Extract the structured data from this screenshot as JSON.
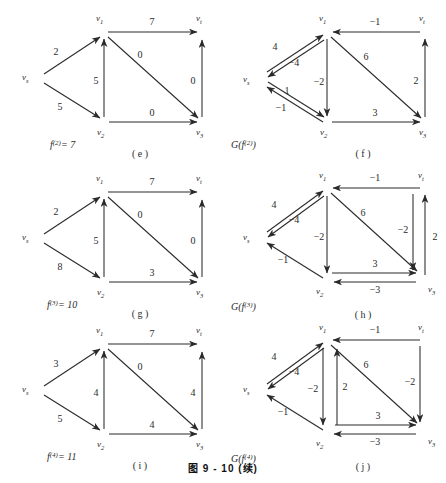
{
  "figure": {
    "caption": "图 9 - 10 (续)",
    "nodes": {
      "s": "v",
      "s_sub": "s",
      "one": "v",
      "one_sub": "1",
      "two": "v",
      "two_sub": "2",
      "three": "v",
      "three_sub": "3",
      "t": "v",
      "t_sub": "t"
    },
    "ink": "#2a2a2a"
  },
  "panels": [
    {
      "id": "e",
      "letter": "( e )",
      "title": "f",
      "title_sup": "(2)",
      "title_eq": "= 7",
      "kind": "flow",
      "edges": [
        {
          "name": "vs-v1",
          "label": "2"
        },
        {
          "name": "vs-v2",
          "label": "5"
        },
        {
          "name": "v2-v1",
          "label": "5"
        },
        {
          "name": "v1-vt",
          "label": "7"
        },
        {
          "name": "v1-v3",
          "label": "0"
        },
        {
          "name": "v2-v3",
          "label": "0"
        },
        {
          "name": "v3-vt",
          "label": "0"
        }
      ]
    },
    {
      "id": "f",
      "letter": "( f )",
      "title": "G(f",
      "title_sup": "(2)",
      "title_eq": ")",
      "kind": "residual",
      "edges": [
        {
          "name": "vs-v1",
          "label": "4"
        },
        {
          "name": "v1-vs",
          "label": "−4"
        },
        {
          "name": "vs-v2",
          "label": "1"
        },
        {
          "name": "v2-vs",
          "label": "−1"
        },
        {
          "name": "v1-v2",
          "label": "−2"
        },
        {
          "name": "vt-v1",
          "label": "−1"
        },
        {
          "name": "v1-v3",
          "label": "6"
        },
        {
          "name": "v2-v3",
          "label": "3"
        },
        {
          "name": "v3-vt",
          "label": "2"
        }
      ]
    },
    {
      "id": "g",
      "letter": "( g )",
      "title": "f",
      "title_sup": "(3)",
      "title_eq": "= 10",
      "kind": "flow",
      "edges": [
        {
          "name": "vs-v1",
          "label": "2"
        },
        {
          "name": "vs-v2",
          "label": "8"
        },
        {
          "name": "v2-v1",
          "label": "5"
        },
        {
          "name": "v1-vt",
          "label": "7"
        },
        {
          "name": "v1-v3",
          "label": "0"
        },
        {
          "name": "v2-v3",
          "label": "3"
        },
        {
          "name": "v3-vt",
          "label": "0"
        }
      ]
    },
    {
      "id": "h",
      "letter": "( h )",
      "title": "G(f",
      "title_sup": "(3)",
      "title_eq": ")",
      "kind": "residual",
      "edges": [
        {
          "name": "vs-v1",
          "label": "4"
        },
        {
          "name": "v1-vs",
          "label": "−4"
        },
        {
          "name": "v2-vs",
          "label": "−1"
        },
        {
          "name": "v1-v2",
          "label": "−2"
        },
        {
          "name": "vt-v1",
          "label": "−1"
        },
        {
          "name": "v1-v3",
          "label": "6"
        },
        {
          "name": "v2-v3",
          "label": "3"
        },
        {
          "name": "v3-v2",
          "label": "−3"
        },
        {
          "name": "vt-v3",
          "label": "−2"
        },
        {
          "name": "v3-vt",
          "label": "2"
        }
      ]
    },
    {
      "id": "i",
      "letter": "( i )",
      "title": "f",
      "title_sup": "(4)",
      "title_eq": "= 11",
      "kind": "flow",
      "edges": [
        {
          "name": "vs-v1",
          "label": "3"
        },
        {
          "name": "vs-v2",
          "label": "5"
        },
        {
          "name": "v2-v1",
          "label": "4"
        },
        {
          "name": "v1-vt",
          "label": "7"
        },
        {
          "name": "v1-v3",
          "label": "0"
        },
        {
          "name": "v2-v3",
          "label": "4"
        },
        {
          "name": "v3-vt",
          "label": "4"
        }
      ]
    },
    {
      "id": "j",
      "letter": "( j )",
      "title": "G(f",
      "title_sup": "(4)",
      "title_eq": ")",
      "kind": "residual",
      "edges": [
        {
          "name": "vs-v1",
          "label": "4"
        },
        {
          "name": "v1-vs",
          "label": "−4"
        },
        {
          "name": "v2-vs",
          "label": "−1"
        },
        {
          "name": "v1-v2",
          "label": "−2"
        },
        {
          "name": "v2-v1",
          "label": "2"
        },
        {
          "name": "vt-v1",
          "label": "−1"
        },
        {
          "name": "v1-v3",
          "label": "6"
        },
        {
          "name": "v2-v3",
          "label": "3"
        },
        {
          "name": "v3-v2",
          "label": "−3"
        },
        {
          "name": "vt-v3",
          "label": "−2"
        }
      ]
    }
  ]
}
